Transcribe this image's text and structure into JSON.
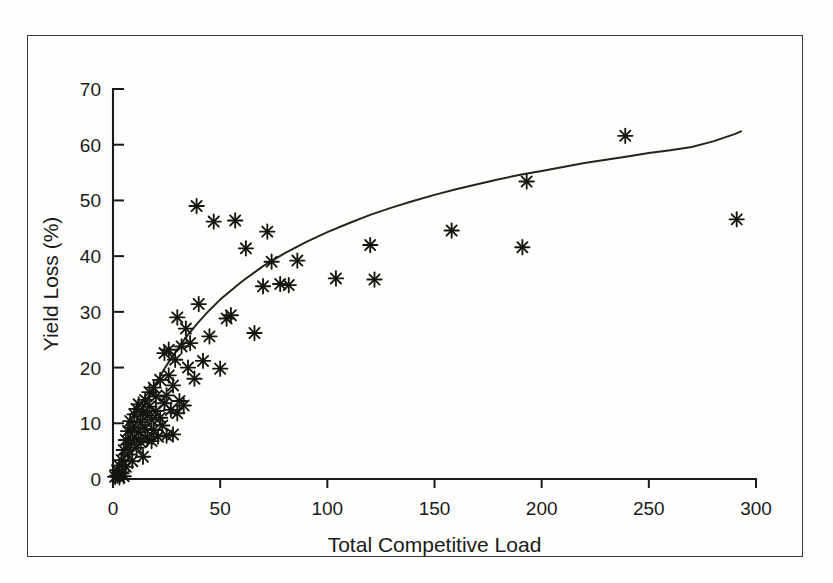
{
  "figure": {
    "background_color": "#fdfdfb",
    "frame_color": "#3a3a36",
    "marker_color": "#141410",
    "curve_color": "#25251f",
    "axis_color": "#1a1a1a"
  },
  "chart_data": {
    "type": "scatter",
    "title": "",
    "xlabel": "Total Competitive Load",
    "ylabel": "Yield Loss (%)",
    "xlim": [
      0,
      300
    ],
    "ylim": [
      0,
      70
    ],
    "xticks": [
      0,
      50,
      100,
      150,
      200,
      250,
      300
    ],
    "yticks": [
      0,
      10,
      20,
      30,
      40,
      50,
      60,
      70
    ],
    "xtick_labels": [
      "0",
      "50",
      "100",
      "150",
      "200",
      "250",
      "300"
    ],
    "ytick_labels": [
      "0",
      "10",
      "20",
      "30",
      "40",
      "50",
      "60",
      "70"
    ],
    "grid": false,
    "legend": null,
    "marker_style": "asterisk",
    "series": [
      {
        "name": "Observations",
        "marker": "asterisk",
        "points": [
          [
            1,
            0.4
          ],
          [
            2,
            0.6
          ],
          [
            2,
            1.6
          ],
          [
            3,
            0.3
          ],
          [
            3,
            2.4
          ],
          [
            4,
            1.0
          ],
          [
            4,
            3.4
          ],
          [
            5,
            0.5
          ],
          [
            5,
            5.2
          ],
          [
            6,
            2.2
          ],
          [
            6,
            7.0
          ],
          [
            7,
            4.4
          ],
          [
            7,
            8.6
          ],
          [
            8,
            6.2
          ],
          [
            8,
            10.4
          ],
          [
            9,
            3.2
          ],
          [
            9,
            9.2
          ],
          [
            10,
            7.4
          ],
          [
            10,
            11.6
          ],
          [
            11,
            5.6
          ],
          [
            11,
            12.6
          ],
          [
            12,
            8.4
          ],
          [
            12,
            13.4
          ],
          [
            13,
            6.6
          ],
          [
            13,
            10.2
          ],
          [
            14,
            4.0
          ],
          [
            14,
            12.0
          ],
          [
            15,
            9.0
          ],
          [
            15,
            14.2
          ],
          [
            16,
            7.2
          ],
          [
            16,
            11.4
          ],
          [
            17,
            13.0
          ],
          [
            17,
            15.6
          ],
          [
            18,
            6.8
          ],
          [
            18,
            10.6
          ],
          [
            19,
            8.8
          ],
          [
            19,
            16.4
          ],
          [
            20,
            12.2
          ],
          [
            20,
            14.8
          ],
          [
            21,
            7.6
          ],
          [
            22,
            11.0
          ],
          [
            22,
            17.8
          ],
          [
            23,
            9.6
          ],
          [
            24,
            13.6
          ],
          [
            24,
            22.6
          ],
          [
            25,
            7.8
          ],
          [
            25,
            15.0
          ],
          [
            26,
            18.6
          ],
          [
            26,
            23.2
          ],
          [
            27,
            12.4
          ],
          [
            28,
            8.0
          ],
          [
            28,
            16.8
          ],
          [
            29,
            21.4
          ],
          [
            30,
            11.8
          ],
          [
            30,
            29.0
          ],
          [
            31,
            14.0
          ],
          [
            32,
            23.8
          ],
          [
            33,
            13.2
          ],
          [
            34,
            27.0
          ],
          [
            35,
            20.0
          ],
          [
            36,
            24.4
          ],
          [
            38,
            18.0
          ],
          [
            39,
            49.0
          ],
          [
            40,
            31.4
          ],
          [
            42,
            21.2
          ],
          [
            45,
            25.6
          ],
          [
            47,
            46.2
          ],
          [
            50,
            19.8
          ],
          [
            53,
            28.8
          ],
          [
            55,
            29.4
          ],
          [
            57,
            46.4
          ],
          [
            62,
            41.4
          ],
          [
            66,
            26.2
          ],
          [
            70,
            34.6
          ],
          [
            72,
            44.4
          ],
          [
            74,
            39.0
          ],
          [
            78,
            35.0
          ],
          [
            82,
            34.8
          ],
          [
            86,
            39.2
          ],
          [
            104,
            36.0
          ],
          [
            120,
            42.0
          ],
          [
            122,
            35.8
          ],
          [
            158,
            44.6
          ],
          [
            191,
            41.6
          ],
          [
            193,
            53.4
          ],
          [
            239,
            61.6
          ],
          [
            291,
            46.6
          ]
        ]
      }
    ],
    "fit_curve": {
      "name": "Fitted response curve",
      "model": "saturating",
      "points": [
        [
          0,
          0
        ],
        [
          5,
          5.0
        ],
        [
          10,
          9.6
        ],
        [
          15,
          13.6
        ],
        [
          20,
          17.2
        ],
        [
          25,
          20.4
        ],
        [
          30,
          23.3
        ],
        [
          35,
          25.9
        ],
        [
          40,
          28.2
        ],
        [
          45,
          30.3
        ],
        [
          50,
          32.2
        ],
        [
          60,
          35.4
        ],
        [
          70,
          38.2
        ],
        [
          80,
          40.5
        ],
        [
          90,
          42.5
        ],
        [
          100,
          44.3
        ],
        [
          110,
          45.9
        ],
        [
          120,
          47.4
        ],
        [
          130,
          48.7
        ],
        [
          140,
          49.9
        ],
        [
          150,
          51.0
        ],
        [
          160,
          52.0
        ],
        [
          170,
          52.9
        ],
        [
          180,
          53.8
        ],
        [
          190,
          54.6
        ],
        [
          200,
          55.3
        ],
        [
          210,
          56.0
        ],
        [
          220,
          56.7
        ],
        [
          230,
          57.3
        ],
        [
          240,
          57.9
        ],
        [
          250,
          58.5
        ],
        [
          260,
          59.0
        ],
        [
          270,
          59.6
        ],
        [
          280,
          60.6
        ],
        [
          290,
          61.9
        ],
        [
          293,
          62.4
        ]
      ]
    }
  }
}
